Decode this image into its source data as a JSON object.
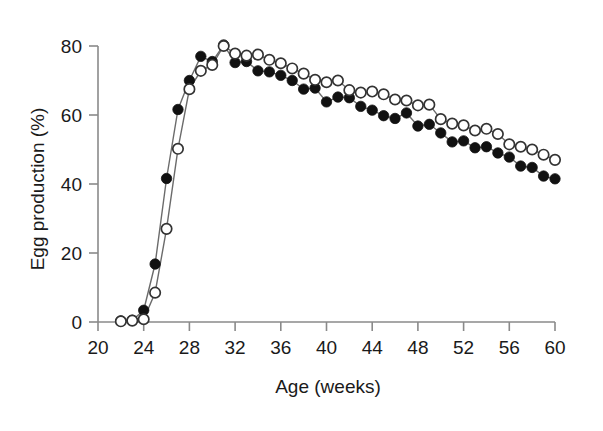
{
  "chart_data": {
    "type": "line",
    "title": "",
    "xlabel": "Age (weeks)",
    "ylabel": "Egg production (%)",
    "xlim": [
      20,
      60
    ],
    "ylim": [
      0,
      80
    ],
    "xticks": [
      20,
      24,
      28,
      32,
      36,
      40,
      44,
      48,
      52,
      56,
      60
    ],
    "xtick_labels": [
      "20",
      "24",
      "28",
      "32",
      "36",
      "40",
      "44",
      "48",
      "52",
      "56",
      "60"
    ],
    "yticks": [
      0,
      20,
      40,
      60,
      80
    ],
    "ytick_labels": [
      "0",
      "20",
      "40",
      "60",
      "80"
    ],
    "grid": false,
    "legend": "none",
    "x": [
      22,
      23,
      24,
      25,
      26,
      27,
      28,
      29,
      30,
      31,
      32,
      33,
      34,
      35,
      36,
      37,
      38,
      39,
      40,
      41,
      42,
      43,
      44,
      45,
      46,
      47,
      48,
      49,
      50,
      51,
      52,
      53,
      54,
      55,
      56,
      57,
      58,
      59,
      60
    ],
    "series": [
      {
        "name": "closed-circles",
        "marker": "filled-circle",
        "color": "#111111",
        "values": [
          0.3,
          0.5,
          3.4,
          16.8,
          41.6,
          61.6,
          70.0,
          77.0,
          75.5,
          80.3,
          75.2,
          75.5,
          72.8,
          72.5,
          71.5,
          70.0,
          67.5,
          67.8,
          63.8,
          65.2,
          65.0,
          62.5,
          61.4,
          59.8,
          59.0,
          60.6,
          56.8,
          57.3,
          54.8,
          52.2,
          52.5,
          50.5,
          50.8,
          49.0,
          47.8,
          45.2,
          44.8,
          42.3,
          41.5
        ]
      },
      {
        "name": "open-circles",
        "marker": "open-circle",
        "color": "#111111",
        "values": [
          0.2,
          0.4,
          0.8,
          8.5,
          27.0,
          50.2,
          67.5,
          72.8,
          74.5,
          80.0,
          77.8,
          77.2,
          77.5,
          76.0,
          75.0,
          73.5,
          72.0,
          70.2,
          69.5,
          70.0,
          67.2,
          66.5,
          66.8,
          66.0,
          64.5,
          64.2,
          62.8,
          63.0,
          58.8,
          57.5,
          57.0,
          55.5,
          56.0,
          54.5,
          51.5,
          50.8,
          50.0,
          48.5,
          47.0
        ]
      }
    ]
  },
  "axes_geometry": {
    "left_px": 98,
    "right_px": 555,
    "bottom_px": 322,
    "top_px": 46
  }
}
